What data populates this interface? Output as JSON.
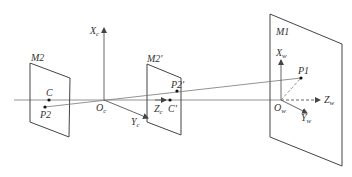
{
  "diagram": {
    "type": "camera-projection-geometry",
    "colors": {
      "line": "#555555",
      "text": "#333333",
      "background": "#ffffff"
    },
    "planes": [
      {
        "id": "M2",
        "label": "M2",
        "corners": [
          [
            30,
            63
          ],
          [
            70,
            78
          ],
          [
            69,
            137
          ],
          [
            30,
            122
          ]
        ]
      },
      {
        "id": "M2p",
        "label": "M2'",
        "corners": [
          [
            147,
            64
          ],
          [
            181,
            78
          ],
          [
            181,
            135
          ],
          [
            147,
            122
          ]
        ]
      },
      {
        "id": "M1",
        "label": "M1",
        "corners": [
          [
            270,
            14
          ],
          [
            342,
            44
          ],
          [
            342,
            166
          ],
          [
            270,
            137
          ]
        ]
      }
    ],
    "points": [
      {
        "id": "C",
        "label": "C",
        "x": 49,
        "y": 100
      },
      {
        "id": "P2",
        "label": "P2",
        "x": 45,
        "y": 107
      },
      {
        "id": "P2p",
        "label": "P2'",
        "x": 177,
        "y": 91
      },
      {
        "id": "Cp",
        "label": "C'",
        "x": 170,
        "y": 100
      },
      {
        "id": "P1",
        "label": "P1",
        "x": 301,
        "y": 78
      }
    ],
    "camera_axes": {
      "origin": {
        "label": "O",
        "sub": "c"
      },
      "x": {
        "label": "X",
        "sub": "c"
      },
      "y": {
        "label": "Y",
        "sub": "c"
      },
      "z": {
        "label": "Z",
        "sub": "c"
      }
    },
    "world_axes": {
      "origin": {
        "label": "O",
        "sub": "w"
      },
      "x": {
        "label": "X",
        "sub": "w"
      },
      "y": {
        "label": "Y",
        "sub": "w"
      },
      "z": {
        "label": "Z",
        "sub": "w"
      }
    },
    "labels": {
      "m2": "M2",
      "m2p": "M2'",
      "m1": "M1",
      "c": "C",
      "p2": "P2",
      "p2p": "P2'",
      "cp": "C'",
      "p1": "P1"
    }
  }
}
